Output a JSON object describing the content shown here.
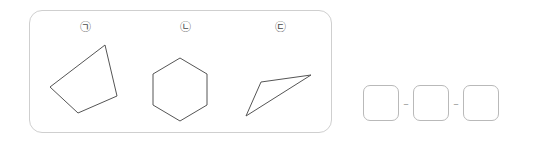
{
  "figure_panel": {
    "name": "shape-comparison-panel",
    "items": [
      {
        "label": "㉠",
        "shape_name": "quadrilateral",
        "points": "59,8 71,59 32,76 4,50",
        "sides": 4
      },
      {
        "label": "㉡",
        "shape_name": "hexagon",
        "points": "29,3 56,19 56,50 29,66 2,50 2,19",
        "sides": 6
      },
      {
        "label": "㉢",
        "shape_name": "triangle",
        "points": "22,27 72,20 7,61",
        "sides": 3
      }
    ]
  },
  "answer_row": {
    "name": "answer-boxes",
    "boxes": [
      {
        "value": ""
      },
      {
        "value": ""
      },
      {
        "value": ""
      }
    ],
    "separators": [
      "–",
      "–"
    ]
  },
  "colors": {
    "panel_border": "#cfcfcf",
    "shape_stroke": "#555555",
    "shape_fill": "#ffffff",
    "label_text": "#4a4a4a",
    "box_border": "#b9b9b9",
    "dash": "#9a9a9a",
    "background": "#ffffff"
  }
}
